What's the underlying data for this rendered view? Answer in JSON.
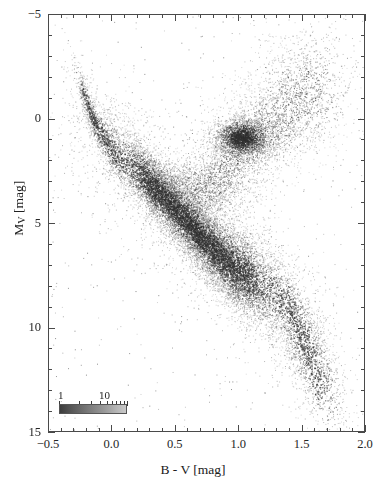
{
  "figure": {
    "plot_area": {
      "left": 48,
      "top": 14,
      "width": 317,
      "height": 418
    }
  },
  "axes": {
    "x": {
      "title": "B - V [mag]",
      "unit": "mag",
      "symbol": "B - V",
      "min": -0.5,
      "max": 2.0,
      "major_ticks": [
        -0.5,
        0.0,
        0.5,
        1.0,
        1.5,
        2.0
      ],
      "major_tick_labels": [
        "−0.5",
        "0.0",
        "0.5",
        "1.0",
        "1.5",
        "2.0"
      ],
      "minor_tick_step": 0.1,
      "direction": "normal"
    },
    "y": {
      "title_prefix": "M",
      "title_sub": "V",
      "title_suffix": " [mag]",
      "title": "M_V [mag]",
      "unit": "mag",
      "min": -5,
      "max": 15,
      "major_ticks": [
        -5,
        0,
        5,
        10,
        15
      ],
      "major_tick_labels": [
        "−5",
        "0",
        "5",
        "10",
        "15"
      ],
      "minor_tick_step": 1,
      "direction": "inverted"
    }
  },
  "legend": {
    "name": "density-colorbar",
    "scale": "logarithmic",
    "label_low": "1",
    "label_high": "10",
    "value_low": 1,
    "value_high": 10,
    "tick_values": [
      1,
      2,
      3,
      4,
      5,
      6,
      7,
      8,
      9,
      10
    ],
    "gradient_dark": "#3c3c3c",
    "gradient_light": "#c9c9c9"
  },
  "chart_data": {
    "type": "scatter",
    "title": "",
    "subtitle": "",
    "xlabel": "B - V [mag]",
    "ylabel": "M_V [mag]",
    "xlim": [
      -0.5,
      2.0
    ],
    "ylim": [
      15,
      -5
    ],
    "y_inverted": true,
    "grid": false,
    "legend_position": "inside-bottom-left",
    "point_color": "#303030",
    "point_size_px": 1.2,
    "approx_point_count": 22000,
    "density_colormap": "grayscale-log",
    "annotations": [],
    "features": [
      {
        "name": "main-sequence",
        "description": "Dominant diagonal band running from upper-left (hot blue stars) to lower-right (cool red dwarfs).",
        "point_count": 15000,
        "ridge_points": [
          {
            "x": -0.22,
            "y": -1.2
          },
          {
            "x": -0.15,
            "y": 0.1
          },
          {
            "x": -0.05,
            "y": 1.1
          },
          {
            "x": 0.05,
            "y": 1.8
          },
          {
            "x": 0.18,
            "y": 2.5
          },
          {
            "x": 0.32,
            "y": 3.2
          },
          {
            "x": 0.45,
            "y": 4.0
          },
          {
            "x": 0.58,
            "y": 4.8
          },
          {
            "x": 0.68,
            "y": 5.5
          },
          {
            "x": 0.8,
            "y": 6.2
          },
          {
            "x": 0.92,
            "y": 6.9
          },
          {
            "x": 1.05,
            "y": 7.4
          },
          {
            "x": 1.2,
            "y": 7.9
          },
          {
            "x": 1.35,
            "y": 8.6
          },
          {
            "x": 1.45,
            "y": 9.6
          },
          {
            "x": 1.52,
            "y": 10.7
          },
          {
            "x": 1.58,
            "y": 11.8
          },
          {
            "x": 1.65,
            "y": 12.8
          }
        ],
        "width_sigma": 0.075
      },
      {
        "name": "red-clump",
        "description": "Dense concentration of core-helium-burning giants.",
        "center": {
          "x": 1.02,
          "y": 0.85
        },
        "sigma": {
          "x": 0.11,
          "y": 0.45
        },
        "point_count": 2600
      },
      {
        "name": "red-giant-branch",
        "description": "Branch rising from the subgiant region up to the right of the clump.",
        "point_count": 2800,
        "ridge_points": [
          {
            "x": 0.72,
            "y": 3.6
          },
          {
            "x": 0.82,
            "y": 3.0
          },
          {
            "x": 0.9,
            "y": 2.4
          },
          {
            "x": 0.98,
            "y": 1.7
          },
          {
            "x": 1.08,
            "y": 1.0
          },
          {
            "x": 1.2,
            "y": 0.4
          },
          {
            "x": 1.32,
            "y": -0.2
          },
          {
            "x": 1.45,
            "y": -0.8
          },
          {
            "x": 1.55,
            "y": -1.4
          },
          {
            "x": 1.62,
            "y": -2.1
          }
        ],
        "width_sigma": 0.085
      },
      {
        "name": "subgiant-branch",
        "description": "Sparse bridge between the main sequence turnoff and the giant branch.",
        "point_count": 900,
        "ridge_points": [
          {
            "x": 0.48,
            "y": 2.9
          },
          {
            "x": 0.58,
            "y": 3.1
          },
          {
            "x": 0.68,
            "y": 3.3
          },
          {
            "x": 0.78,
            "y": 3.4
          },
          {
            "x": 0.88,
            "y": 3.3
          }
        ],
        "width_sigma": 0.1
      },
      {
        "name": "scattered-outliers",
        "description": "Sparse isolated field stars scattered across the diagram.",
        "point_count": 420
      }
    ]
  }
}
